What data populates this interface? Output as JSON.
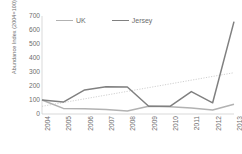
{
  "chart_data": {
    "type": "line",
    "title": "",
    "xlabel": "",
    "ylabel": "Abundance Index (2004=100)",
    "categories": [
      "2004",
      "2005",
      "2006",
      "2007",
      "2008",
      "2009",
      "2010",
      "2011",
      "2012",
      "2013"
    ],
    "ylim": [
      0,
      700
    ],
    "yticks": [
      0,
      100,
      200,
      300,
      400,
      500,
      600,
      700
    ],
    "grid": false,
    "legend_position": "top-left",
    "series": [
      {
        "name": "UK",
        "color": "#b2b2b2",
        "values": [
          100,
          40,
          38,
          33,
          22,
          55,
          52,
          43,
          28,
          70
        ]
      },
      {
        "name": "Jersey",
        "color": "#808080",
        "values": [
          100,
          85,
          172,
          195,
          193,
          55,
          55,
          160,
          80,
          660
        ]
      }
    ],
    "annotations": [
      {
        "name": "trendline",
        "type": "dotted-linear-trend",
        "color": "#c4c4c4",
        "start": {
          "x": "2004",
          "y": 55
        },
        "end": {
          "x": "2013",
          "y": 295
        }
      }
    ]
  },
  "legend": {
    "items": [
      {
        "label": "UK",
        "color": "#b2b2b2"
      },
      {
        "label": "Jersey",
        "color": "#808080"
      }
    ]
  },
  "axes": {
    "y_title": "Abundance Index (2004=100)",
    "y_tick_labels": [
      "700",
      "600",
      "500",
      "400",
      "300",
      "200",
      "100",
      "0"
    ],
    "x_tick_labels": [
      "2004",
      "2005",
      "2006",
      "2007",
      "2008",
      "2009",
      "2010",
      "2011",
      "2012",
      "2013"
    ]
  }
}
